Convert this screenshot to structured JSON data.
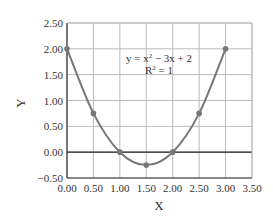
{
  "chart_data": {
    "type": "scatter",
    "title": "",
    "xlabel": "X",
    "ylabel": "Y",
    "xlim": [
      0,
      3.5
    ],
    "ylim": [
      -0.5,
      2.5
    ],
    "grid": true,
    "x_ticks": [
      "0.00",
      "0.50",
      "1.00",
      "1.50",
      "2.00",
      "2.50",
      "3.00",
      "3.50"
    ],
    "y_ticks": [
      "2.50",
      "2.00",
      "1.50",
      "1.00",
      "0.50",
      "0.00",
      "−0.50"
    ],
    "series": [
      {
        "name": "data",
        "x": [
          0,
          0.5,
          1.0,
          1.5,
          2.0,
          2.5,
          3.0
        ],
        "y": [
          2.0,
          0.75,
          0.0,
          -0.25,
          0.0,
          0.75,
          2.0
        ],
        "line": "smooth",
        "color": "#777777"
      }
    ],
    "trendline": {
      "equation": "y = x² − 3x + 2",
      "r_squared": "R² = 1"
    },
    "legend": null
  },
  "labels": {
    "xlabel": "X",
    "ylabel": "Y",
    "equation_prefix": "y = x",
    "equation_sup": "2",
    "equation_suffix": " − 3x + 2",
    "r2_prefix": "R",
    "r2_sup": "2",
    "r2_suffix": " = 1"
  },
  "colors": {
    "grid": "#bbbbbb",
    "axis": "#333333",
    "series": "#777777"
  }
}
